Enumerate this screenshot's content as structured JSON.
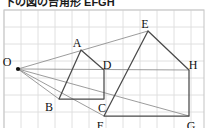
{
  "caption": {
    "text": "下の図の台角形 EFGH"
  },
  "figure": {
    "type": "geometry-diagram",
    "grid": {
      "visible": true,
      "cell_size": 17,
      "color": "#dcdcdc",
      "border_color": "#c8c8c8",
      "x_start": 4,
      "x_end": 204,
      "y_start": 3,
      "y_end": 122
    },
    "colors": {
      "stroke": "#4a4a4a",
      "ray": "#8a8a8a",
      "point": "#111111",
      "label": "#111111",
      "background": "#ffffff"
    },
    "points": [
      {
        "name": "O",
        "x": 18,
        "y": 62,
        "label_dx": -11,
        "label_dy": -6,
        "dot": true
      },
      {
        "name": "A",
        "x": 81,
        "y": 43,
        "label_dx": -4,
        "label_dy": -6,
        "dot": false
      },
      {
        "name": "B",
        "x": 59,
        "y": 92,
        "label_dx": -10,
        "label_dy": 9,
        "dot": false
      },
      {
        "name": "C",
        "x": 104,
        "y": 92,
        "label_dx": -2,
        "label_dy": 10,
        "dot": false
      },
      {
        "name": "D",
        "x": 104,
        "y": 63,
        "label_dx": 3,
        "label_dy": -4,
        "dot": false
      },
      {
        "name": "E",
        "x": 148,
        "y": 24,
        "label_dx": -3,
        "label_dy": -6,
        "dot": false
      },
      {
        "name": "F",
        "x": 104,
        "y": 109,
        "label_dx": -4,
        "label_dy": 11,
        "dot": false
      },
      {
        "name": "G",
        "x": 189,
        "y": 109,
        "label_dx": 2,
        "label_dy": 11,
        "dot": false
      },
      {
        "name": "H",
        "x": 189,
        "y": 63,
        "label_dx": 4,
        "label_dy": -4,
        "dot": false
      }
    ],
    "shapes": [
      {
        "name": "pentagon-ABCD",
        "vertices": [
          "A",
          "B",
          "C",
          "D"
        ],
        "closed": true
      },
      {
        "name": "quadrilateral-EFGH",
        "vertices": [
          "E",
          "F",
          "G",
          "H"
        ],
        "closed": true
      }
    ],
    "rays": [
      {
        "name": "ray-O-to-E",
        "from": "O",
        "to": "E"
      },
      {
        "name": "ray-O-to-B",
        "from": "O",
        "to": "B"
      },
      {
        "name": "ray-O-to-F",
        "from": "O",
        "to": "F"
      },
      {
        "name": "ray-O-to-H",
        "from": "O",
        "to": "H"
      },
      {
        "name": "ray-O-to-G",
        "from": "O",
        "to": "G"
      }
    ]
  }
}
